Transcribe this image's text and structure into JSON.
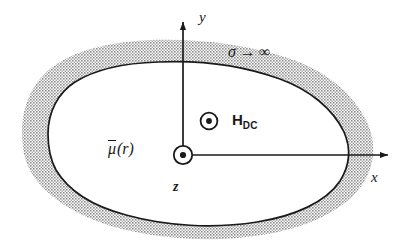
{
  "figure": {
    "background_color": "#ffffff",
    "ink_color": "#1a1a1a",
    "shell_fill_color": "#b0b0b0",
    "interior_fill_color": "#ffffff"
  },
  "axes": {
    "x_label": "x",
    "y_label": "y",
    "z_label": "z",
    "origin": {
      "x": 183,
      "y": 155
    },
    "x_axis": {
      "from_x": 183,
      "to_x": 388,
      "y": 155
    },
    "y_axis": {
      "x": 183,
      "from_y": 155,
      "to_y": 22
    }
  },
  "annotations": {
    "conductivity": {
      "symbol": "σ",
      "arrow": "→",
      "limit": "∞",
      "full_text": "σ → ∞"
    },
    "permeability": {
      "symbol": "μ",
      "argument": "(r)",
      "full_text": "μ̄ (r)",
      "overbar": true
    },
    "bias_field": {
      "symbol": "H",
      "subscript": "DC",
      "full_text": "H_DC",
      "direction_marker": "out-of-page-dot"
    }
  },
  "markers": {
    "origin_dot": "circled-dot-out-of-page",
    "hdc_dot": "circled-dot-out-of-page"
  },
  "shapes": {
    "outer_boundary_path": "M 22,132 C 22,104 34,80 54,66 C 78,49 112,42 150,40 C 196,38 246,44 288,58 C 324,70 352,92 366,120 C 376,140 376,162 364,182 C 348,208 312,226 268,234 C 218,243 164,240 118,228 C 78,217 48,198 32,174 C 24,161 22,146 22,132 Z",
    "inner_boundary_path": "M 48,134 C 48,112 58,93 75,82 C 96,69 126,63 158,62 C 200,60 244,66 280,79 C 310,90 333,109 344,132 C 351,148 350,165 340,181 C 326,202 295,216 257,222 C 213,229 166,226 126,215 C 92,206 68,190 56,170 C 50,159 48,146 48,134 Z"
  },
  "labels": {
    "sigma_pos": {
      "x": 228,
      "y": 44
    },
    "mu_pos": {
      "x": 108,
      "y": 140
    },
    "hdc_pos": {
      "x": 232,
      "y": 112
    },
    "hdc_dot_pos": {
      "x": 209,
      "y": 121
    },
    "x_label_pos": {
      "x": 371,
      "y": 170
    },
    "y_label_pos": {
      "x": 199,
      "y": 10
    },
    "z_label_pos": {
      "x": 173,
      "y": 180
    }
  }
}
